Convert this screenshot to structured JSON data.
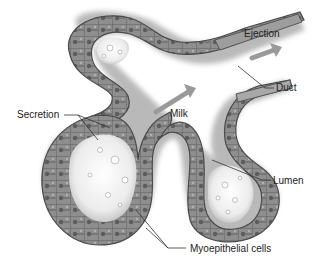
{
  "diagram": {
    "colors": {
      "background": "#ffffff",
      "tissue_dark": "#5a5a5a",
      "tissue_mid": "#8c8c8c",
      "tissue_light": "#c8c8c8",
      "lumen": "#f2f2f2",
      "arrow": "#9a9a9a",
      "leader": "#333333",
      "text": "#222222"
    },
    "labels": {
      "ejection": "Ejection",
      "duct": "Duct",
      "milk": "Milk",
      "secretion": "Secretion",
      "lumen": "Lumen",
      "myoepithelial": "Myoepithelial cells"
    }
  }
}
